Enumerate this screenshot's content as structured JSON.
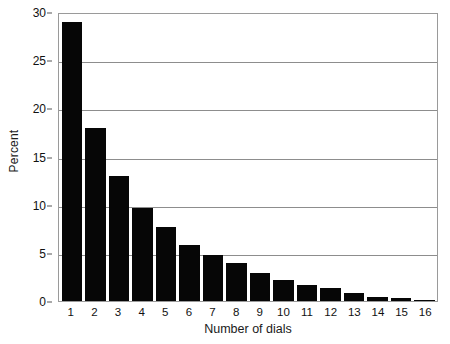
{
  "chart_data": {
    "type": "bar",
    "title": "",
    "subtitle": "",
    "xlabel": "Number of dials",
    "ylabel": "Percent",
    "categories": [
      "1",
      "2",
      "3",
      "4",
      "5",
      "6",
      "7",
      "8",
      "9",
      "10",
      "11",
      "12",
      "13",
      "14",
      "15",
      "16"
    ],
    "values": [
      29,
      18,
      13,
      9.7,
      7.7,
      5.8,
      4.8,
      3.9,
      2.9,
      2.2,
      1.7,
      1.4,
      0.8,
      0.45,
      0.3,
      0.15
    ],
    "ylim": [
      0,
      30
    ],
    "yticks": [
      0,
      5,
      10,
      15,
      20,
      25,
      30
    ],
    "ytick_labels": [
      "0",
      "5",
      "10",
      "15",
      "20",
      "25",
      "30"
    ],
    "grid": true,
    "grid_axis": "y",
    "legend": false,
    "legend_position": "none",
    "bar_color": "#060606",
    "grid_color": "#8d8d8d",
    "frame_color": "#9a9a9a",
    "background_color": "#ffffff",
    "annotations": []
  }
}
